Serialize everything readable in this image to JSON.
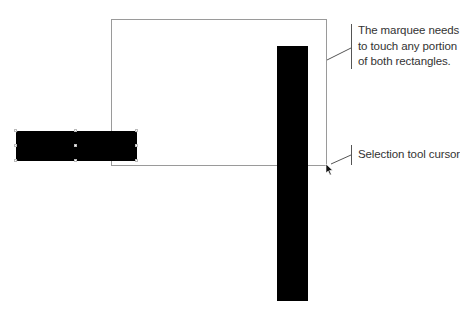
{
  "diagram": {
    "marquee": {
      "label": "Selection marquee",
      "border_color": "#9a9a9a"
    },
    "shapes": [
      {
        "name": "horizontal-rectangle",
        "fill": "#000000"
      },
      {
        "name": "vertical-rectangle",
        "fill": "#000000"
      }
    ],
    "callouts": [
      {
        "lines": [
          "The marquee needs",
          "to touch any portion",
          "of both rectangles."
        ]
      },
      {
        "lines": [
          "Selection tool cursor"
        ]
      }
    ],
    "cursor": {
      "icon": "arrow-pointer-icon"
    }
  }
}
